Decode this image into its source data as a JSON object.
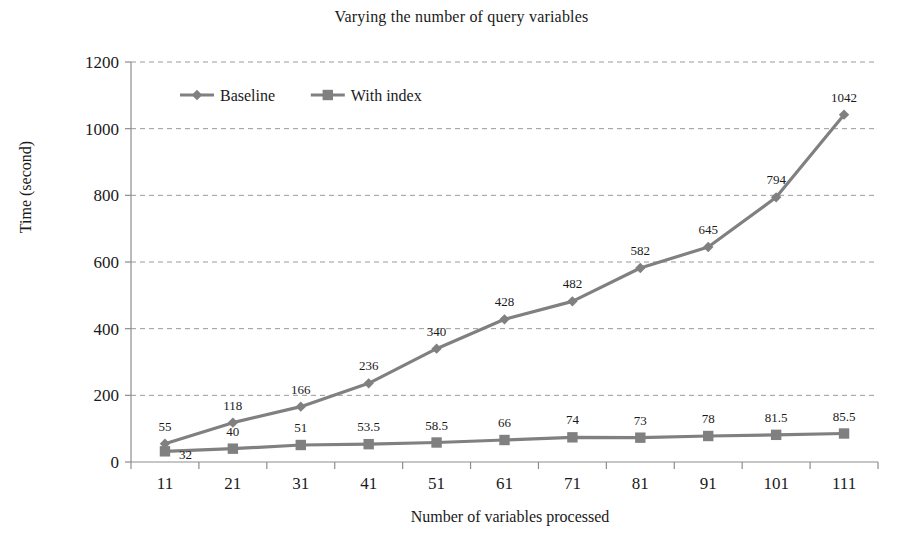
{
  "chart_data": {
    "type": "line",
    "title": "Varying the number of query variables",
    "xlabel": "Number of variables processed",
    "ylabel": "Time (second)",
    "categories": [
      "11",
      "21",
      "31",
      "41",
      "51",
      "61",
      "71",
      "81",
      "91",
      "101",
      "111"
    ],
    "ylim": [
      0,
      1200
    ],
    "yticks": [
      "0",
      "200",
      "400",
      "600",
      "800",
      "1000",
      "1200"
    ],
    "ytick_values": [
      0,
      200,
      400,
      600,
      800,
      1000,
      1200
    ],
    "grid": "horizontal-dashed",
    "legend_position": "top-left-inside",
    "series": [
      {
        "name": "Baseline",
        "marker": "diamond",
        "color": "#808080",
        "values": [
          55,
          118,
          166,
          236,
          340,
          428,
          482,
          582,
          645,
          794,
          1042
        ],
        "labels": [
          "55",
          "118",
          "166",
          "236",
          "340",
          "428",
          "482",
          "582",
          "645",
          "794",
          "1042"
        ]
      },
      {
        "name": "With index",
        "marker": "square",
        "color": "#808080",
        "values": [
          32,
          40,
          51,
          53.5,
          58.5,
          66,
          74,
          73,
          78,
          81.5,
          85.5
        ],
        "labels": [
          "32",
          "40",
          "51",
          "53.5",
          "58.5",
          "66",
          "74",
          "73",
          "78",
          "81.5",
          "85.5"
        ]
      }
    ]
  },
  "colors": {
    "series_line": "#808080",
    "grid": "#9a9a9a",
    "axis": "#8d8d8d",
    "text": "#1a1a1a",
    "background": "#ffffff"
  }
}
